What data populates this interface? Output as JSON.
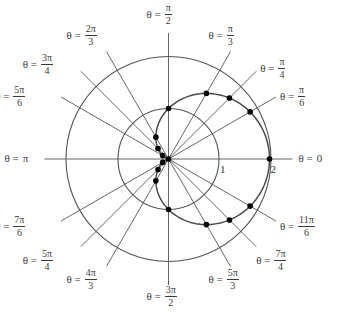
{
  "chart_data": {
    "type": "line",
    "coordinate_system": "polar",
    "title": "",
    "curve": {
      "name": "cardioid",
      "equation": "r = 1 + cos(theta)",
      "color": "#555555"
    },
    "reference_circles": [
      {
        "r": 1,
        "label": "1"
      },
      {
        "r": 2,
        "label": "2"
      }
    ],
    "r_max": 2,
    "rays": [
      {
        "theta_num": 0,
        "theta_den": 6,
        "label_pre": "θ =",
        "label_num": "",
        "label_den": "",
        "label_plain": "0"
      },
      {
        "theta_num": 1,
        "theta_den": 6,
        "label_pre": "θ =",
        "label_num": "π",
        "label_den": "6",
        "label_plain": ""
      },
      {
        "theta_num": 1,
        "theta_den": 4,
        "label_pre": "θ =",
        "label_num": "π",
        "label_den": "4",
        "label_plain": ""
      },
      {
        "theta_num": 1,
        "theta_den": 3,
        "label_pre": "θ =",
        "label_num": "π",
        "label_den": "3",
        "label_plain": ""
      },
      {
        "theta_num": 1,
        "theta_den": 2,
        "label_pre": "θ =",
        "label_num": "π",
        "label_den": "2",
        "label_plain": ""
      },
      {
        "theta_num": 2,
        "theta_den": 3,
        "label_pre": "θ =",
        "label_num": "2π",
        "label_den": "3",
        "label_plain": ""
      },
      {
        "theta_num": 3,
        "theta_den": 4,
        "label_pre": "θ =",
        "label_num": "3π",
        "label_den": "4",
        "label_plain": ""
      },
      {
        "theta_num": 5,
        "theta_den": 6,
        "label_pre": "θ =",
        "label_num": "5π",
        "label_den": "6",
        "label_plain": ""
      },
      {
        "theta_num": 1,
        "theta_den": 1,
        "label_pre": "θ =",
        "label_num": "",
        "label_den": "",
        "label_plain": "π"
      },
      {
        "theta_num": 7,
        "theta_den": 6,
        "label_pre": "θ =",
        "label_num": "7π",
        "label_den": "6",
        "label_plain": ""
      },
      {
        "theta_num": 5,
        "theta_den": 4,
        "label_pre": "θ =",
        "label_num": "5π",
        "label_den": "4",
        "label_plain": ""
      },
      {
        "theta_num": 4,
        "theta_den": 3,
        "label_pre": "θ =",
        "label_num": "4π",
        "label_den": "3",
        "label_plain": ""
      },
      {
        "theta_num": 3,
        "theta_den": 2,
        "label_pre": "θ =",
        "label_num": "3π",
        "label_den": "2",
        "label_plain": ""
      },
      {
        "theta_num": 5,
        "theta_den": 3,
        "label_pre": "θ =",
        "label_num": "5π",
        "label_den": "3",
        "label_plain": ""
      },
      {
        "theta_num": 7,
        "theta_den": 4,
        "label_pre": "θ =",
        "label_num": "7π",
        "label_den": "4",
        "label_plain": ""
      },
      {
        "theta_num": 11,
        "theta_den": 6,
        "label_pre": "θ =",
        "label_num": "11π",
        "label_den": "6",
        "label_plain": ""
      }
    ],
    "points": [
      {
        "theta": "0",
        "r": 2.0
      },
      {
        "theta": "π/6",
        "r": 1.866
      },
      {
        "theta": "π/4",
        "r": 1.707
      },
      {
        "theta": "π/3",
        "r": 1.5
      },
      {
        "theta": "π/2",
        "r": 1.0
      },
      {
        "theta": "2π/3",
        "r": 0.5
      },
      {
        "theta": "3π/4",
        "r": 0.293
      },
      {
        "theta": "5π/6",
        "r": 0.134
      },
      {
        "theta": "π",
        "r": 0.0
      },
      {
        "theta": "7π/6",
        "r": 0.134
      },
      {
        "theta": "5π/4",
        "r": 0.293
      },
      {
        "theta": "4π/3",
        "r": 0.5
      },
      {
        "theta": "3π/2",
        "r": 1.0
      },
      {
        "theta": "5π/3",
        "r": 1.5
      },
      {
        "theta": "7π/4",
        "r": 1.707
      },
      {
        "theta": "11π/6",
        "r": 1.866
      }
    ],
    "grid": false,
    "legend": "none"
  }
}
